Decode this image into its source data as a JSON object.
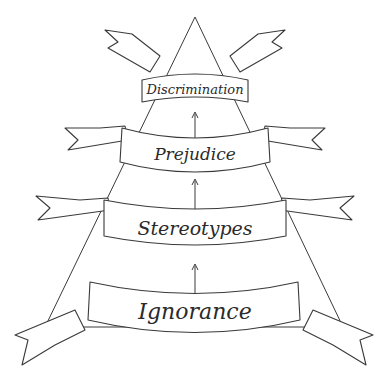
{
  "diagram": {
    "type": "pyramid",
    "direction": "bottom-to-top",
    "levels": [
      {
        "label": "Discrimination",
        "order": 4
      },
      {
        "label": "Prejudice",
        "order": 3
      },
      {
        "label": "Stereotypes",
        "order": 2
      },
      {
        "label": "Ignorance",
        "order": 1
      }
    ],
    "colors": {
      "stroke": "#3a3a3a",
      "ribbon_fill": "#ffffff",
      "background": "#ffffff"
    }
  }
}
